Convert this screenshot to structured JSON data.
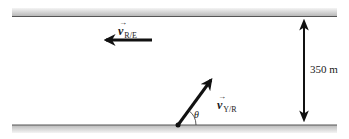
{
  "diagram": {
    "colors": {
      "bank_line": "#555555",
      "bank_shade_dark": "#b8b8b8",
      "bank_shade_light": "#f4f4f4",
      "arrow": "#111111"
    },
    "labels": {
      "river_velocity": {
        "symbol": "v",
        "subscript": "R/E",
        "vector_arrow": "→"
      },
      "boat_velocity": {
        "symbol": "v",
        "subscript": "Y/R",
        "vector_arrow": "→"
      },
      "angle": "θ",
      "width": "350 m"
    },
    "elements": {
      "river_velocity_arrow": {
        "direction": "left"
      },
      "boat_velocity_arrow": {
        "direction": "up-right",
        "angle_symbol": "θ"
      },
      "width_dimension": {
        "value": 350,
        "unit": "m"
      }
    }
  }
}
